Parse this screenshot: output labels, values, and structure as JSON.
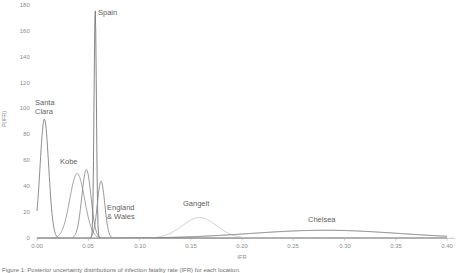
{
  "chart_data": {
    "type": "line",
    "title": "",
    "xlabel": "IFR",
    "ylabel": "P(IFR)",
    "xlim": [
      0.0,
      0.4
    ],
    "ylim": [
      0,
      180
    ],
    "grid": false,
    "legend_position": "inline-annotations",
    "xticks": [
      "0.00",
      "0.05",
      "0.10",
      "0.15",
      "0.20",
      "0.25",
      "0.30",
      "0.35",
      "0.40"
    ],
    "xtick_values": [
      0.0,
      0.05,
      0.1,
      0.15,
      0.2,
      0.25,
      0.3,
      0.35,
      0.4
    ],
    "yticks": [
      "0",
      "20",
      "40",
      "60",
      "80",
      "100",
      "120",
      "140",
      "160",
      "180"
    ],
    "ytick_values": [
      0,
      20,
      40,
      60,
      80,
      100,
      120,
      140,
      160,
      180
    ],
    "series": [
      {
        "name": "Santa Clara",
        "label": "Santa\nClara",
        "color": "#808080",
        "peak_x": 0.0072,
        "peak_y": 92,
        "sigma": 0.0042,
        "label_x": 35,
        "label_y": 98
      },
      {
        "name": "Kobe",
        "label": "Kobe",
        "color": "#9a9a9a",
        "peak_x": 0.0392,
        "peak_y": 50,
        "sigma": 0.0072,
        "label_x": 60,
        "label_y": 157
      },
      {
        "name": "Unlabeled-secondary",
        "label": "",
        "color": "#8d8d8d",
        "peak_x": 0.0482,
        "peak_y": 53,
        "sigma": 0.0045,
        "label_x": 0,
        "label_y": 0
      },
      {
        "name": "Spain",
        "label": "Spain",
        "color": "#777777",
        "peak_x": 0.0568,
        "peak_y": 176,
        "sigma": 0.00115,
        "label_x": 98,
        "label_y": 8
      },
      {
        "name": "England & Wales",
        "label": "England\n& Wales",
        "color": "#8a8a8a",
        "peak_x": 0.0625,
        "peak_y": 44,
        "sigma": 0.0036,
        "label_x": 107,
        "label_y": 203
      },
      {
        "name": "Gangelt",
        "label": "Gangelt",
        "color": "#c3c3c3",
        "peak_x": 0.1585,
        "peak_y": 16,
        "sigma": 0.0168,
        "label_x": 183,
        "label_y": 199
      },
      {
        "name": "Chelsea",
        "label": "Chelsea",
        "color": "#6b6b6b",
        "peak_x": 0.281,
        "peak_y": 6.2,
        "sigma": 0.072,
        "label_x": 308,
        "label_y": 215
      }
    ]
  },
  "axes": {
    "x_label": "IFR",
    "y_label": "P(IFR)"
  },
  "caption": {
    "text": "Figure 1: Posterior uncertainty distributions of infection fatality rate (IFR) for each location."
  }
}
